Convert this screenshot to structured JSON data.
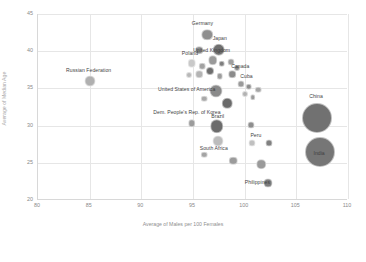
{
  "chart_data": {
    "type": "scatter",
    "title": "",
    "xlabel": "Average of Males per 100 Females",
    "ylabel": "Average of Median Age",
    "xlim": [
      80,
      110
    ],
    "ylim": [
      20,
      45
    ],
    "xticks": [
      80,
      85,
      90,
      95,
      100,
      105,
      110
    ],
    "yticks": [
      20,
      25,
      30,
      35,
      40,
      45
    ],
    "grid": true,
    "legend": "none",
    "note": "Bubble size encodes population; bubbles rendered in grayscale.",
    "points": [
      {
        "label": "Germany",
        "x": 96.4,
        "y": 42.2,
        "size": 11.5,
        "color": "#8f8f8f",
        "label_dx": -4,
        "label_dy": -11
      },
      {
        "label": "Japan",
        "x": 97.5,
        "y": 40.2,
        "size": 12.5,
        "color": "#6f6f6f",
        "label_dx": 2,
        "label_dy": -11
      },
      {
        "label": "",
        "x": 95.6,
        "y": 40.1,
        "size": 7.5,
        "color": "#8c8c8c",
        "label_dx": 0,
        "label_dy": 0
      },
      {
        "label": "United Kingdom",
        "x": 96.9,
        "y": 38.8,
        "size": 9.5,
        "color": "#9a9a9a",
        "label_dx": 0,
        "label_dy": -9
      },
      {
        "label": "Poland",
        "x": 94.9,
        "y": 38.4,
        "size": 8.5,
        "color": "#c9c9c9",
        "label_dx": -1,
        "label_dy": -9
      },
      {
        "label": "",
        "x": 95.9,
        "y": 38.0,
        "size": 6.5,
        "color": "#a2a2a2",
        "label_dx": 0,
        "label_dy": 0
      },
      {
        "label": "",
        "x": 97.8,
        "y": 38.3,
        "size": 6.5,
        "color": "#7e7e7e",
        "label_dx": 0,
        "label_dy": 0
      },
      {
        "label": "",
        "x": 98.7,
        "y": 38.5,
        "size": 7.0,
        "color": "#9f9f9f",
        "label_dx": 0,
        "label_dy": 0
      },
      {
        "label": "",
        "x": 99.3,
        "y": 37.8,
        "size": 6.0,
        "color": "#888888",
        "label_dx": 0,
        "label_dy": 0
      },
      {
        "label": "",
        "x": 96.6,
        "y": 37.3,
        "size": 8.0,
        "color": "#6e6e6e",
        "label_dx": 0,
        "label_dy": 0
      },
      {
        "label": "",
        "x": 95.6,
        "y": 36.9,
        "size": 7.5,
        "color": "#b4b4b4",
        "label_dx": 0,
        "label_dy": 0
      },
      {
        "label": "",
        "x": 97.6,
        "y": 36.6,
        "size": 6.5,
        "color": "#9c9c9c",
        "label_dx": 0,
        "label_dy": 0
      },
      {
        "label": "",
        "x": 94.6,
        "y": 36.8,
        "size": 6.0,
        "color": "#b8b8b8",
        "label_dx": 0,
        "label_dy": 0
      },
      {
        "label": "Russian Federation",
        "x": 85.0,
        "y": 36.0,
        "size": 11.0,
        "color": "#b0b0b0",
        "label_dx": 0,
        "label_dy": -10
      },
      {
        "label": "Canada",
        "x": 98.8,
        "y": 36.9,
        "size": 7.5,
        "color": "#8b8b8b",
        "label_dx": 9,
        "label_dy": -7
      },
      {
        "label": "Cuba",
        "x": 99.6,
        "y": 35.6,
        "size": 7.0,
        "color": "#9a9a9a",
        "label_dx": 7,
        "label_dy": -7
      },
      {
        "label": "",
        "x": 100.4,
        "y": 35.2,
        "size": 6.5,
        "color": "#8d8d8d",
        "label_dx": 0,
        "label_dy": 0
      },
      {
        "label": "",
        "x": 101.3,
        "y": 34.8,
        "size": 6.5,
        "color": "#a6a6a6",
        "label_dx": 0,
        "label_dy": 0
      },
      {
        "label": "",
        "x": 100.0,
        "y": 34.2,
        "size": 6.0,
        "color": "#b2b2b2",
        "label_dx": 0,
        "label_dy": 0
      },
      {
        "label": "",
        "x": 100.8,
        "y": 33.8,
        "size": 5.5,
        "color": "#9b9b9b",
        "label_dx": 0,
        "label_dy": 0
      },
      {
        "label": "United States of America",
        "x": 97.2,
        "y": 34.6,
        "size": 13.0,
        "color": "#8a8a8a",
        "label_dx": -28,
        "label_dy": -1
      },
      {
        "label": "",
        "x": 98.3,
        "y": 33.0,
        "size": 10.5,
        "color": "#6a6a6a",
        "label_dx": 0,
        "label_dy": 0
      },
      {
        "label": "",
        "x": 96.1,
        "y": 33.6,
        "size": 6.5,
        "color": "#a9a9a9",
        "label_dx": 0,
        "label_dy": 0
      },
      {
        "label": "China",
        "x": 107.0,
        "y": 31.0,
        "size": 30.0,
        "color": "#717171",
        "label_dx": 0,
        "label_dy": -21
      },
      {
        "label": "India",
        "x": 107.3,
        "y": 26.4,
        "size": 30.0,
        "color": "#767676",
        "label_dx": 0,
        "label_dy": 2
      },
      {
        "label": "Dem. People's Rep. of Korea",
        "x": 94.9,
        "y": 30.3,
        "size": 7.5,
        "color": "#9c9c9c",
        "label_dx": -4,
        "label_dy": -10
      },
      {
        "label": "Brazil",
        "x": 97.3,
        "y": 29.9,
        "size": 13.5,
        "color": "#6c6c6c",
        "label_dx": 2,
        "label_dy": -9
      },
      {
        "label": "",
        "x": 100.6,
        "y": 30.1,
        "size": 7.0,
        "color": "#8e8e8e",
        "label_dx": 0,
        "label_dy": 0
      },
      {
        "label": "South Africa",
        "x": 97.4,
        "y": 27.9,
        "size": 11.0,
        "color": "#bcbcbc",
        "label_dx": -3,
        "label_dy": 8
      },
      {
        "label": "Peru",
        "x": 100.7,
        "y": 27.7,
        "size": 7.0,
        "color": "#c0c0c0",
        "label_dx": 5,
        "label_dy": -7
      },
      {
        "label": "",
        "x": 102.4,
        "y": 27.6,
        "size": 7.0,
        "color": "#808080",
        "label_dx": 0,
        "label_dy": 0
      },
      {
        "label": "",
        "x": 96.1,
        "y": 26.1,
        "size": 6.5,
        "color": "#a4a4a4",
        "label_dx": 0,
        "label_dy": 0
      },
      {
        "label": "",
        "x": 98.9,
        "y": 25.3,
        "size": 8.5,
        "color": "#9b9b9b",
        "label_dx": 0,
        "label_dy": 0
      },
      {
        "label": "",
        "x": 101.6,
        "y": 24.8,
        "size": 9.5,
        "color": "#9a9a9a",
        "label_dx": 0,
        "label_dy": 0
      },
      {
        "label": "Philippines",
        "x": 102.3,
        "y": 22.3,
        "size": 9.0,
        "color": "#7d7d7d",
        "label_dx": -10,
        "label_dy": 0
      }
    ]
  }
}
